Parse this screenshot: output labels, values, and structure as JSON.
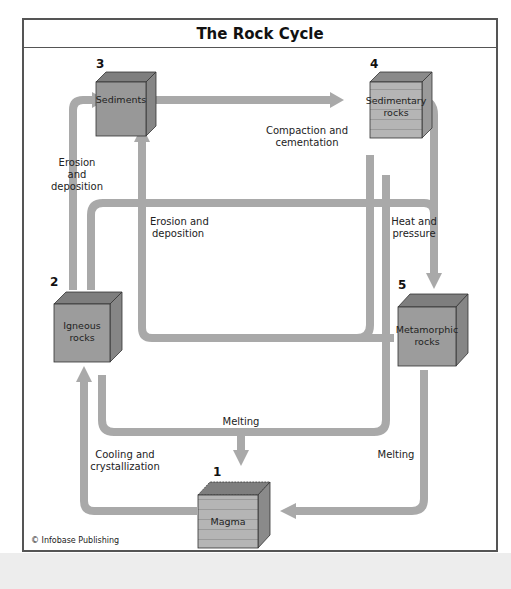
{
  "title": "The Rock Cycle",
  "credit": "© Infobase Publishing",
  "colors": {
    "pipe": "#a9a9a9",
    "frame": "#555555",
    "box_front": "#9a9a9a",
    "box_top": "#7d7d7d",
    "box_side": "#858585",
    "sedimentary_front": "#b4b4b4"
  },
  "nodes": [
    {
      "id": "magma",
      "number": "1",
      "label_lines": [
        "Magma"
      ]
    },
    {
      "id": "igneous",
      "number": "2",
      "label_lines": [
        "Igneous",
        "rocks"
      ]
    },
    {
      "id": "sediments",
      "number": "3",
      "label_lines": [
        "Sediments"
      ]
    },
    {
      "id": "sedimentary",
      "number": "4",
      "label_lines": [
        "Sedimentary",
        "rocks"
      ]
    },
    {
      "id": "metamorphic",
      "number": "5",
      "label_lines": [
        "Metamorphic",
        "rocks"
      ]
    }
  ],
  "processes": {
    "erosion_left": [
      "Erosion",
      "and",
      "deposition"
    ],
    "erosion_mid": [
      "Erosion and",
      "deposition"
    ],
    "compaction": [
      "Compaction and",
      "cementation"
    ],
    "heat_pressure": [
      "Heat and",
      "pressure"
    ],
    "melting_center": "Melting",
    "melting_right": "Melting",
    "cooling": [
      "Cooling and",
      "crystallization"
    ]
  }
}
